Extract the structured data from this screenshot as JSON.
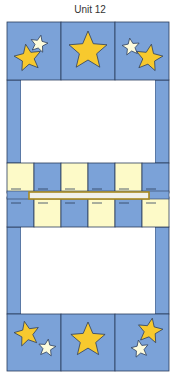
{
  "title": "Unit 12",
  "colors": {
    "blue": "#7ba2d8",
    "cream": "#fdfac8",
    "star_gold": "#f7c92e",
    "star_light": "#fdfbdc",
    "outline": "#2c3e5c",
    "rod_gold": "#a8891e",
    "rod_fill": "#f1f1ea",
    "white": "#ffffff"
  },
  "top_row_blocks": [
    {
      "stars": [
        "gold",
        "light"
      ]
    },
    {
      "stars": [
        "gold"
      ]
    },
    {
      "stars": [
        "light",
        "gold"
      ]
    }
  ],
  "bottom_row_blocks": [
    {
      "stars": [
        "gold",
        "light"
      ]
    },
    {
      "stars": [
        "gold"
      ]
    },
    {
      "stars": [
        "gold",
        "light"
      ]
    }
  ],
  "checker_top": [
    "cream",
    "blue",
    "cream",
    "blue",
    "cream",
    "blue"
  ],
  "checker_bottom": [
    "blue",
    "cream",
    "blue",
    "cream",
    "blue",
    "cream"
  ]
}
